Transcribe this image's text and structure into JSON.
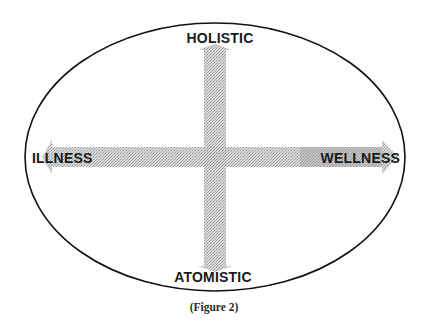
{
  "diagram": {
    "axes": {
      "top_label": "HOLISTIC",
      "bottom_label": "ATOMISTIC",
      "left_label": "ILLNESS",
      "right_label": "WELLNESS"
    },
    "caption": "(Figure 2)",
    "colors": {
      "ellipse_stroke": "#111111",
      "arrow_fill": "#b8b8b8",
      "text": "#1a1a1a",
      "background": "#ffffff"
    }
  }
}
